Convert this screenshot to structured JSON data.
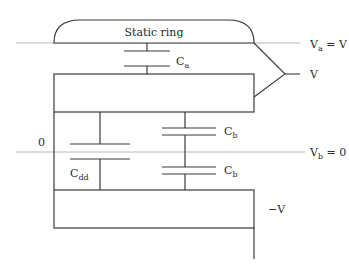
{
  "diagram": {
    "static_ring_label": "Static ring",
    "capacitors": {
      "ca": {
        "main": "C",
        "sub": "a"
      },
      "cb_upper": {
        "main": "C",
        "sub": "b"
      },
      "cb_lower": {
        "main": "C",
        "sub": "b"
      },
      "cdd": {
        "main": "C",
        "sub": "dd"
      }
    },
    "potentials": {
      "va": {
        "main": "V",
        "sub": "a",
        "rest": " = V"
      },
      "v": "V",
      "vb": {
        "main": "V",
        "sub": "b",
        "rest": " = 0"
      },
      "zero": "0",
      "neg_v": "−V"
    },
    "colors": {
      "line": "#3a3a3a",
      "reference_line": "#b8b8b8",
      "text": "#2a2a2a"
    }
  }
}
